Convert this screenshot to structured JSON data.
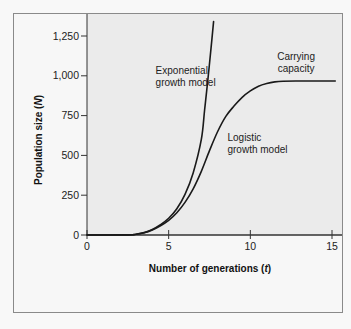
{
  "chart_data": {
    "type": "line",
    "title": "",
    "xlabel": "Number of generations (t)",
    "xlabel_parts": {
      "main": "Number of generations (",
      "var": "t",
      "end": ")"
    },
    "ylabel": "Population size (N)",
    "ylabel_parts": {
      "main": "Population size (",
      "var": "N",
      "end": ")"
    },
    "xlim": [
      0,
      15.5
    ],
    "ylim": [
      0,
      1300
    ],
    "x_ticks": [
      0,
      5,
      10,
      15
    ],
    "x_tick_labels": [
      "0",
      "5",
      "10",
      "15"
    ],
    "y_ticks": [
      0,
      250,
      500,
      750,
      1000,
      1250
    ],
    "y_tick_labels": [
      "0",
      "250",
      "500",
      "750",
      "1,000",
      "1,250"
    ],
    "grid": false,
    "legend": null,
    "series": [
      {
        "name": "Exponential growth model",
        "x": [
          0,
          2.5,
          3,
          3.5,
          4,
          4.5,
          5,
          5.5,
          6,
          6.5,
          7,
          7.2,
          7.4,
          7.6,
          7.75
        ],
        "y": [
          0,
          1,
          5,
          15,
          35,
          65,
          105,
          165,
          255,
          390,
          600,
          785,
          975,
          1180,
          1340
        ]
      },
      {
        "name": "Logistic growth model",
        "x": [
          0,
          2.5,
          3,
          3.5,
          4,
          4.5,
          5,
          5.5,
          6,
          6.5,
          7,
          7.5,
          8,
          8.5,
          9,
          9.5,
          10,
          10.5,
          11,
          11.5,
          12,
          13,
          14,
          15.2
        ],
        "y": [
          0,
          1,
          5,
          14,
          32,
          58,
          92,
          140,
          205,
          290,
          400,
          530,
          650,
          745,
          810,
          865,
          905,
          935,
          952,
          962,
          966,
          967,
          967,
          967
        ]
      }
    ],
    "annotations": [
      {
        "text_lines": [
          "Exponential",
          "growth model"
        ],
        "x": 4.2,
        "y": 1010
      },
      {
        "text_lines": [
          "Logistic",
          "growth model"
        ],
        "x": 8.6,
        "y": 590
      },
      {
        "text_lines": [
          "Carrying",
          "capacity"
        ],
        "x": 12.8,
        "y": 1100
      }
    ],
    "carrying_capacity": 967
  },
  "colors": {
    "curve": "#1a1a1a",
    "plot_bg": "#ebebeb",
    "page_bg": "#f8f8f8",
    "frame": "#8a8a8a",
    "axis": "#333333"
  }
}
